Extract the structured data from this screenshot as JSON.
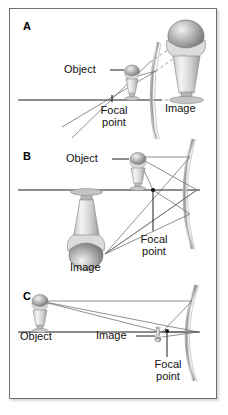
{
  "figure": {
    "type": "optics-ray-diagram",
    "panel_count": 3,
    "border_color": "#6f6f6f",
    "background": "#ffffff",
    "line_color": "#555555",
    "axis_color": "#1a1a1a",
    "text_color": "#111111"
  },
  "panels": [
    {
      "id": "A",
      "letter": "A",
      "case": "object inside focal point - virtual, upright, magnified image",
      "labels": {
        "object": "Object",
        "focal_point_line1": "Focal",
        "focal_point_line2": "point",
        "image": "Image"
      },
      "elements": {
        "mirror": "concave-mirror-arc",
        "axis": "principal-axis",
        "solid_rays": "incident-and-reflected-rays",
        "dashed_rays": "virtual-ray-extensions",
        "object_figure": "small-sundae-upright",
        "image_figure": "large-sundae-upright"
      }
    },
    {
      "id": "B",
      "letter": "B",
      "case": "object between focal point and center - real, inverted, magnified image",
      "labels": {
        "object": "Object",
        "focal_point_line1": "Focal",
        "focal_point_line2": "point",
        "image": "Image"
      },
      "elements": {
        "mirror": "concave-mirror-arc",
        "axis": "principal-axis",
        "solid_rays": "incident-and-reflected-rays",
        "focal_marker": "focal-point-dot",
        "object_figure": "small-sundae-upright",
        "image_figure": "large-sundae-inverted"
      }
    },
    {
      "id": "C",
      "letter": "C",
      "case": "object far beyond center - real, inverted, reduced image near focal point",
      "labels": {
        "object": "Object",
        "focal_point_line1": "Focal",
        "focal_point_line2": "point",
        "image": "Image"
      },
      "elements": {
        "mirror": "concave-mirror-arc",
        "axis": "principal-axis",
        "solid_rays": "incident-and-reflected-rays",
        "focal_marker": "focal-point-dot",
        "object_figure": "medium-sundae-upright",
        "image_figure": "tiny-sundae-inverted"
      }
    }
  ]
}
